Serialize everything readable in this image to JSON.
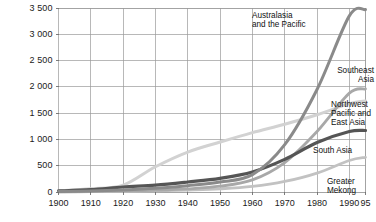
{
  "chart_data": {
    "type": "line",
    "title": "",
    "subtitle": "",
    "xlabel": "",
    "ylabel": "",
    "xlim": [
      1900,
      1995
    ],
    "ylim": [
      0,
      3500
    ],
    "grid": true,
    "legend_position": "inline-right-of-lines",
    "y_ticks": [
      0,
      500,
      1000,
      1500,
      2000,
      2500,
      3000,
      3500
    ],
    "y_tick_labels": [
      "0",
      "500",
      "1 000",
      "1 500",
      "2 000",
      "2 500",
      "3 000",
      "3 500"
    ],
    "x_ticks": [
      1900,
      1910,
      1920,
      1930,
      1940,
      1950,
      1960,
      1970,
      1980,
      1990,
      1995
    ],
    "x_tick_labels": [
      "1900",
      "1910",
      "1920",
      "1930",
      "1940",
      "1950",
      "1960",
      "1970",
      "1980",
      "1990",
      "95"
    ],
    "x": [
      1900,
      1910,
      1920,
      1930,
      1940,
      1950,
      1960,
      1970,
      1980,
      1990,
      1995
    ],
    "series": [
      {
        "name": "Australasia and the Pacific",
        "color": "#8a8a8a",
        "width": 3.0,
        "values": [
          10,
          20,
          40,
          70,
          120,
          190,
          330,
          900,
          1950,
          3350,
          3470
        ]
      },
      {
        "name": "Southeast Asia",
        "color": "#a8a8a8",
        "width": 2.8,
        "values": [
          5,
          10,
          20,
          35,
          60,
          110,
          230,
          560,
          1150,
          1880,
          1960
        ]
      },
      {
        "name": "Northwest Pacific and East Asia",
        "color": "#d2d2d2",
        "width": 3.0,
        "values": [
          20,
          60,
          130,
          480,
          760,
          950,
          1130,
          1290,
          1470,
          1680,
          1730
        ]
      },
      {
        "name": "South Asia",
        "color": "#555555",
        "width": 3.2,
        "values": [
          20,
          45,
          95,
          130,
          190,
          260,
          380,
          620,
          940,
          1150,
          1170
        ]
      },
      {
        "name": "Greater Mekong",
        "color": "#c2c2c2",
        "width": 2.8,
        "values": [
          3,
          6,
          12,
          22,
          38,
          60,
          105,
          200,
          360,
          600,
          660
        ]
      }
    ],
    "annotations": [
      {
        "id": "australasia",
        "text": "Australasia\nand the Pacific",
        "align": "left"
      },
      {
        "id": "southeast",
        "text": "Southeast\nAsia",
        "align": "right"
      },
      {
        "id": "northwest",
        "text": "Northwest\nPacific and\nEast Asia",
        "align": "left"
      },
      {
        "id": "southasia",
        "text": "South Asia",
        "align": "left"
      },
      {
        "id": "mekong",
        "text": "Greater\nMekong",
        "align": "left"
      }
    ],
    "colors": {
      "background": "#ffffff",
      "grid": "#9a9a9a",
      "axis": "#6e6e6e",
      "text": "#111111"
    }
  }
}
